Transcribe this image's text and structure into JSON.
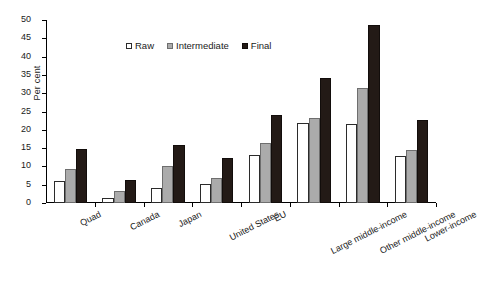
{
  "chart_data": {
    "type": "bar",
    "title": "",
    "xlabel": "",
    "ylabel": "Per cent",
    "ylim": [
      0,
      50
    ],
    "yticks": [
      0,
      5,
      10,
      15,
      20,
      25,
      30,
      35,
      40,
      45,
      50
    ],
    "grid": false,
    "legend_position": "top-center",
    "categories": [
      "Quad",
      "Canada",
      "Japan",
      "United States",
      "EU",
      "Large middle-income",
      "Other middle-income",
      "Lower-income"
    ],
    "series": [
      {
        "name": "Raw",
        "color": "#ffffff",
        "values": [
          6.0,
          1.4,
          4.1,
          5.3,
          13.0,
          21.8,
          21.5,
          12.8
        ]
      },
      {
        "name": "Intermediate",
        "color": "#ababab",
        "values": [
          9.3,
          3.3,
          10.1,
          6.9,
          16.5,
          23.2,
          31.5,
          14.5
        ]
      },
      {
        "name": "Final",
        "color": "#231a16",
        "values": [
          14.7,
          6.3,
          15.8,
          12.3,
          24.0,
          34.1,
          48.7,
          22.7
        ]
      }
    ]
  }
}
